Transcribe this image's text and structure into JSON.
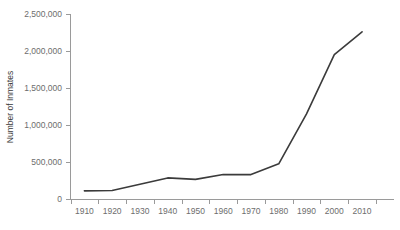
{
  "chart_data": {
    "type": "line",
    "title": "",
    "subtitle": "",
    "xlabel": "",
    "ylabel": "Number of Inmates",
    "x": [
      1910,
      1920,
      1930,
      1940,
      1950,
      1960,
      1970,
      1980,
      1990,
      2000,
      2010
    ],
    "categories": [
      "1910",
      "1920",
      "1930",
      "1940",
      "1950",
      "1960",
      "1970",
      "1980",
      "1990",
      "2000",
      "2010"
    ],
    "values": [
      110000,
      115000,
      200000,
      285000,
      265000,
      330000,
      330000,
      475000,
      1150000,
      1950000,
      2260000
    ],
    "series": [
      {
        "name": "Number of Inmates",
        "values": [
          110000,
          115000,
          200000,
          285000,
          265000,
          330000,
          330000,
          475000,
          1150000,
          1950000,
          2260000
        ]
      }
    ],
    "xlim": [
      1905,
      2015
    ],
    "ylim": [
      0,
      2500000
    ],
    "ytick_values": [
      0,
      500000,
      1000000,
      1500000,
      2000000,
      2500000
    ],
    "ytick_labels": [
      "0",
      "500,000",
      "1,000,000",
      "1,500,000",
      "2,000,000",
      "2,500,000"
    ],
    "xtick_labels": [
      "1910",
      "1920",
      "1930",
      "1940",
      "1950",
      "1960",
      "1970",
      "1980",
      "1990",
      "2000",
      "2010"
    ],
    "grid": false,
    "legend": false,
    "legend_position": "none",
    "line_color": "#3b3b3b",
    "axis_color": "#9a9a9a",
    "tick_label_color": "#6d6d6d",
    "axis_title_color": "#3a3a3a",
    "background_color": "#ffffff"
  }
}
